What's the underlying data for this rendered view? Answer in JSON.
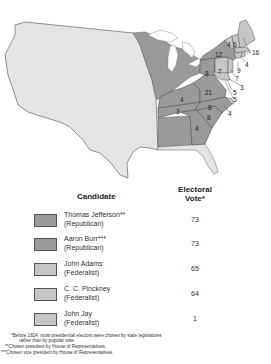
{
  "map": {
    "colors": {
      "jefferson_burr": "#9a9a9a",
      "adams_pinckney": "#c6c6c6",
      "territory": "#e4e4e4",
      "border": "#666666",
      "water": "#ffffff"
    },
    "state_votes": [
      {
        "label": "16",
        "state": "Massachusetts"
      },
      {
        "label": "6",
        "state": "New Hampshire"
      },
      {
        "label": "4",
        "state": "Vermont"
      },
      {
        "label": "12",
        "state": "New York"
      },
      {
        "label": "4",
        "state": "Rhode Island"
      },
      {
        "label": "9",
        "state": "Connecticut"
      },
      {
        "label": "7",
        "state": "New Jersey"
      },
      {
        "label": "3",
        "state": "Delaware"
      },
      {
        "label": "5",
        "state": "Maryland (Federalist)"
      },
      {
        "label": "5",
        "state": "Maryland (Republican)"
      },
      {
        "label": "8",
        "state": "Pennsylvania (West)"
      },
      {
        "label": "7",
        "state": "Pennsylvania (East)"
      },
      {
        "label": "21",
        "state": "Virginia"
      },
      {
        "label": "4",
        "state": "Kentucky"
      },
      {
        "label": "3",
        "state": "Tennessee"
      },
      {
        "label": "8",
        "state": "North Carolina (Republican)"
      },
      {
        "label": "4",
        "state": "North Carolina (Federalist)"
      },
      {
        "label": "8",
        "state": "South Carolina"
      },
      {
        "label": "4",
        "state": "Georgia"
      }
    ]
  },
  "legend": {
    "header_candidate": "Candidate",
    "header_vote": "Electoral Vote*",
    "header_vote_line1": "Electoral",
    "header_vote_line2": "Vote*",
    "rows": [
      {
        "name": "Thomas Jefferson**",
        "party": "(Republican)",
        "votes": "73",
        "color": "#9a9a9a"
      },
      {
        "name": "Aaron Burr***",
        "party": "(Republican)",
        "votes": "73",
        "color": "#9a9a9a"
      },
      {
        "name": "John Adams",
        "party": "(Federalist)",
        "votes": "65",
        "color": "#c6c6c6"
      },
      {
        "name": "C. C. Pinckney",
        "party": "(Federalist)",
        "votes": "64",
        "color": "#c6c6c6"
      },
      {
        "name": "John Jay",
        "party": "(Federalist)",
        "votes": "1",
        "color": "#c6c6c6"
      }
    ]
  },
  "footnotes": {
    "n1_line1": "*Before 1824, most presidential electors were chosen by state legislatures",
    "n1_line2": "rather than by popular vote.",
    "n2": "**Chosen president by House of Representatives.",
    "n3": "***Chosen vice president by House of Representatives."
  }
}
